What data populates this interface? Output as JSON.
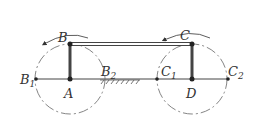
{
  "diagram": {
    "type": "parallelogram-linkage",
    "points": {
      "A": {
        "label": "A",
        "x": 70,
        "y": 79
      },
      "B": {
        "label": "B",
        "x": 70,
        "y": 44
      },
      "C": {
        "label": "C",
        "x": 192,
        "y": 44
      },
      "D": {
        "label": "D",
        "x": 192,
        "y": 79
      },
      "B1": {
        "label": "B",
        "sub": "1",
        "x": 36,
        "y": 79
      },
      "B2": {
        "label": "B",
        "sub": "2",
        "x": 104,
        "y": 79
      },
      "C1": {
        "label": "C",
        "sub": "1",
        "x": 157,
        "y": 79
      },
      "C2": {
        "label": "C",
        "sub": "2",
        "x": 228,
        "y": 79
      }
    },
    "circle_radius": 35,
    "colors": {
      "stroke": "#333333",
      "bar": "#555555",
      "dash": "#666666"
    }
  }
}
